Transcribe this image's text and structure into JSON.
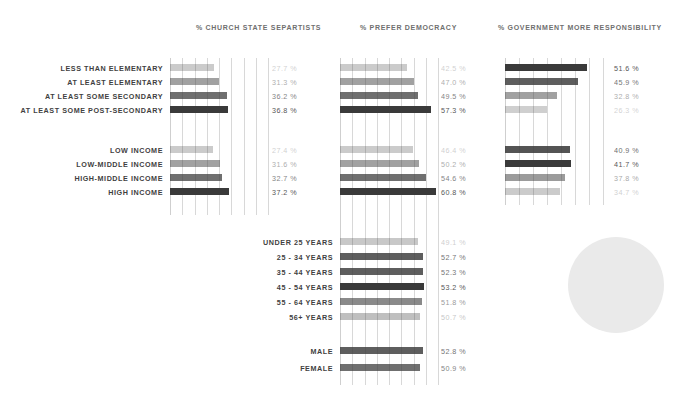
{
  "columns": [
    {
      "key": "church_state",
      "title": "% CHURCH STATE SEPARTISTS",
      "title_x": 196,
      "title_y": 24,
      "plot_x": 170,
      "plot_y": 58,
      "plot_w": 98,
      "plot_h": 157,
      "value_x": 272,
      "scale_max": 62,
      "grid_count": 9
    },
    {
      "key": "prefer_democracy",
      "title": "% PREFER DEMOCRACY",
      "title_x": 360,
      "title_y": 24,
      "plot_x": 340,
      "plot_y": 58,
      "plot_w": 98,
      "plot_h": 327,
      "value_x": 441,
      "scale_max": 62,
      "grid_count": 9
    },
    {
      "key": "gov_responsibility",
      "title": "% GOVERNMENT MORE RESPONSIBILITY",
      "title_x": 498,
      "title_y": 24,
      "plot_x": 505,
      "plot_y": 58,
      "plot_w": 98,
      "plot_h": 147,
      "value_x": 614,
      "scale_max": 62,
      "grid_count": 8
    }
  ],
  "groups": [
    {
      "key": "education",
      "label_x_right": 163,
      "start_y": 64,
      "row_step": 14,
      "rows": [
        {
          "label": "LESS THAN ELEMENTARY"
        },
        {
          "label": "AT LEAST ELEMENTARY"
        },
        {
          "label": "AT LEAST SOME SECONDARY"
        },
        {
          "label": "AT LEAST SOME POST-SECONDARY"
        }
      ]
    },
    {
      "key": "income",
      "label_x_right": 163,
      "start_y": 146,
      "row_step": 14,
      "rows": [
        {
          "label": "LOW INCOME"
        },
        {
          "label": "LOW-MIDDLE INCOME"
        },
        {
          "label": "HIGH-MIDDLE INCOME"
        },
        {
          "label": "HIGH INCOME"
        }
      ]
    },
    {
      "key": "age",
      "label_x_right": 333,
      "start_y": 238,
      "row_step": 15,
      "rows": [
        {
          "label": "UNDER 25 YEARS"
        },
        {
          "label": "25 - 34 YEARS"
        },
        {
          "label": "35 - 44 YEARS"
        },
        {
          "label": "45 - 54 YEARS"
        },
        {
          "label": "55 - 64 YEARS"
        },
        {
          "label": "56+ YEARS"
        }
      ]
    },
    {
      "key": "gender",
      "label_x_right": 333,
      "start_y": 347,
      "row_step": 17,
      "rows": [
        {
          "label": "MALE"
        },
        {
          "label": "FEMALE"
        }
      ]
    }
  ],
  "chart_data": {
    "type": "bar",
    "title": "",
    "orientation": "horizontal",
    "xlabel": "",
    "ylabel": "",
    "xlim": [
      0,
      62
    ],
    "grid": true,
    "value_suffix": "%",
    "panels": [
      {
        "name": "% CHURCH STATE SEPARTISTS",
        "categories": [
          "LESS THAN ELEMENTARY",
          "AT LEAST ELEMENTARY",
          "AT LEAST SOME SECONDARY",
          "AT LEAST SOME POST-SECONDARY",
          "LOW INCOME",
          "LOW-MIDDLE INCOME",
          "HIGH-MIDDLE INCOME",
          "HIGH INCOME"
        ],
        "values": [
          27.7,
          31.3,
          36.2,
          36.8,
          27.4,
          31.6,
          32.7,
          37.2
        ],
        "labels": [
          "27.7 %",
          "31.3 %",
          "36.2 %",
          "36.8 %",
          "27.4 %",
          "31.6 %",
          "32.7 %",
          "37.2 %"
        ],
        "emphasis": [
          0.18,
          0.42,
          0.7,
          1.0,
          0.18,
          0.42,
          0.7,
          1.0
        ]
      },
      {
        "name": "% PREFER DEMOCRACY",
        "categories": [
          "LESS THAN ELEMENTARY",
          "AT LEAST ELEMENTARY",
          "AT LEAST SOME SECONDARY",
          "AT LEAST SOME POST-SECONDARY",
          "LOW INCOME",
          "LOW-MIDDLE INCOME",
          "HIGH-MIDDLE INCOME",
          "HIGH INCOME",
          "UNDER 25 YEARS",
          "25 - 34 YEARS",
          "35 - 44 YEARS",
          "45 - 54 YEARS",
          "55 - 64 YEARS",
          "56+ YEARS",
          "MALE",
          "FEMALE"
        ],
        "values": [
          42.5,
          47.0,
          49.5,
          57.3,
          46.4,
          50.2,
          54.6,
          60.8,
          49.1,
          52.7,
          52.3,
          53.2,
          51.8,
          50.7,
          52.8,
          50.9
        ],
        "labels": [
          "42.5 %",
          "47.0 %",
          "49.5 %",
          "57.3 %",
          "46.4 %",
          "50.2 %",
          "54.6 %",
          "60.8 %",
          "49.1 %",
          "52.7 %",
          "52.3 %",
          "53.2 %",
          "51.8 %",
          "50.7 %",
          "52.8 %",
          "50.9 %"
        ],
        "emphasis": [
          0.18,
          0.42,
          0.7,
          1.0,
          0.18,
          0.42,
          0.7,
          1.0,
          0.2,
          0.8,
          0.8,
          1.0,
          0.55,
          0.25,
          0.8,
          0.7
        ]
      },
      {
        "name": "% GOVERNMENT MORE RESPONSIBILITY",
        "categories": [
          "LESS THAN ELEMENTARY",
          "AT LEAST ELEMENTARY",
          "AT LEAST SOME SECONDARY",
          "AT LEAST SOME POST-SECONDARY",
          "LOW INCOME",
          "LOW-MIDDLE INCOME",
          "HIGH-MIDDLE INCOME",
          "HIGH INCOME"
        ],
        "values": [
          51.6,
          45.9,
          32.8,
          26.3,
          40.9,
          41.7,
          37.8,
          34.7
        ],
        "labels": [
          "51.6 %",
          "45.9 %",
          "32.8 %",
          "26.3 %",
          "40.9 %",
          "41.7 %",
          "37.8 %",
          "34.7 %"
        ],
        "emphasis": [
          1.0,
          0.8,
          0.42,
          0.16,
          0.85,
          1.0,
          0.45,
          0.18
        ]
      }
    ]
  },
  "decor": {
    "circle": {
      "name": "circle-blob",
      "x": 568,
      "y": 237,
      "size": 96,
      "color": "#eaeaea"
    }
  }
}
